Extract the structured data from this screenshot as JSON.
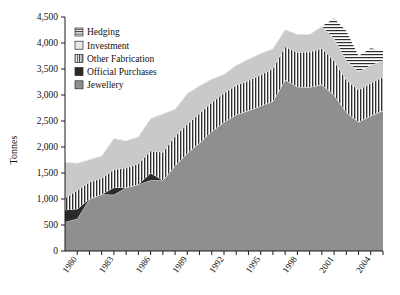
{
  "chart_data": {
    "type": "area",
    "stacked": true,
    "title": "",
    "xlabel": "",
    "ylabel": "Tonnes",
    "ylim": [
      0,
      4500
    ],
    "ytick_step": 500,
    "ytick_labels": [
      "0",
      "500",
      "1,000",
      "1,500",
      "2,000",
      "2,500",
      "3,000",
      "3,500",
      "4,000",
      "4,500"
    ],
    "ytick_values": [
      0,
      500,
      1000,
      1500,
      2000,
      2500,
      3000,
      3500,
      4000,
      4500
    ],
    "grid": false,
    "legend_position": "top-left",
    "x": [
      1979,
      1980,
      1981,
      1982,
      1983,
      1984,
      1985,
      1986,
      1987,
      1988,
      1989,
      1990,
      1991,
      1992,
      1993,
      1994,
      1995,
      1996,
      1997,
      1998,
      1999,
      2000,
      2001,
      2002,
      2003,
      2004,
      2005
    ],
    "xtick_labels": [
      "1980",
      "1983",
      "1986",
      "1989",
      "1992",
      "1995",
      "1998",
      "2001",
      "2004"
    ],
    "xtick_label_values": [
      1980,
      1983,
      1986,
      1989,
      1992,
      1995,
      1998,
      2001,
      2004
    ],
    "xlim": [
      1979,
      2005
    ],
    "series": [
      {
        "name": "Jewellery",
        "fill": "#8f8f8f",
        "pattern": "solid",
        "values": [
          560,
          620,
          1000,
          1090,
          1080,
          1220,
          1280,
          1360,
          1360,
          1640,
          1880,
          2080,
          2300,
          2480,
          2620,
          2700,
          2790,
          2880,
          3290,
          3160,
          3150,
          3200,
          3000,
          2670,
          2480,
          2600,
          2700
        ]
      },
      {
        "name": "Official Purchases",
        "fill": "#2a2a2a",
        "pattern": "solid",
        "values": [
          230,
          190,
          0,
          0,
          140,
          0,
          0,
          140,
          0,
          0,
          0,
          0,
          0,
          0,
          0,
          0,
          0,
          0,
          0,
          0,
          0,
          0,
          0,
          0,
          0,
          0,
          0
        ]
      },
      {
        "name": "Other Fabrication",
        "fill": "#ffffff",
        "pattern": "vertical-lines",
        "values": [
          230,
          360,
          330,
          310,
          350,
          380,
          400,
          430,
          540,
          570,
          560,
          570,
          560,
          560,
          570,
          580,
          600,
          630,
          640,
          660,
          680,
          700,
          660,
          620,
          620,
          630,
          650
        ]
      },
      {
        "name": "Investment",
        "fill": "#c9c9c9",
        "pattern": "solid",
        "values": [
          690,
          520,
          430,
          430,
          600,
          520,
          520,
          620,
          740,
          520,
          590,
          530,
          450,
          360,
          380,
          410,
          410,
          380,
          330,
          350,
          340,
          420,
          430,
          380,
          350,
          340,
          320
        ]
      },
      {
        "name": "Hedging",
        "fill": "#ffffff",
        "pattern": "horizontal-lines",
        "values": [
          0,
          0,
          0,
          0,
          0,
          0,
          0,
          0,
          0,
          0,
          0,
          0,
          0,
          0,
          0,
          0,
          0,
          0,
          0,
          0,
          0,
          0,
          380,
          560,
          300,
          330,
          180
        ]
      }
    ],
    "legend_entries": [
      {
        "label": "Hedging",
        "pattern": "horizontal-lines"
      },
      {
        "label": "Investment",
        "pattern": "solid-light"
      },
      {
        "label": "Other Fabrication",
        "pattern": "vertical-lines"
      },
      {
        "label": "Official Purchases",
        "pattern": "solid-dark"
      },
      {
        "label": "Jewellery",
        "pattern": "solid-gray"
      }
    ],
    "colors": {
      "jewellery": "#8f8f8f",
      "official_purchases": "#2a2a2a",
      "investment": "#c9c9c9",
      "hatch_background": "#ffffff",
      "hatch_stroke": "#2a2a2a",
      "axis": "#1a1a1a"
    }
  }
}
